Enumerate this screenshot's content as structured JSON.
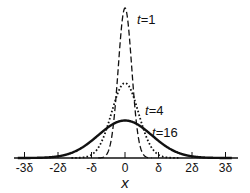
{
  "chart_data": {
    "type": "line",
    "title": "",
    "xlabel": "x",
    "ylabel": "",
    "x_ticks": [
      "-3δ",
      "-2δ",
      "-δ",
      "0",
      "δ",
      "2δ",
      "3δ"
    ],
    "x_tick_values": [
      -3,
      -2,
      -1,
      0,
      1,
      2,
      3
    ],
    "xlim": [
      -3.3,
      3.4
    ],
    "grid": false,
    "legend_position": "inline labels",
    "series": [
      {
        "name": "t=1",
        "label_t": "t",
        "label_val": "=1",
        "style": "dashed",
        "peak": 1.0,
        "sigma_delta": 0.2
      },
      {
        "name": "t=4",
        "label_t": "t",
        "label_val": "=4",
        "style": "dotted",
        "peak": 0.5,
        "sigma_delta": 0.4
      },
      {
        "name": "t=16",
        "label_t": "t",
        "label_val": "=16",
        "style": "solid",
        "peak": 0.25,
        "sigma_delta": 0.8
      }
    ],
    "annotations": [
      "t=1",
      "t=4",
      "t=16"
    ]
  }
}
